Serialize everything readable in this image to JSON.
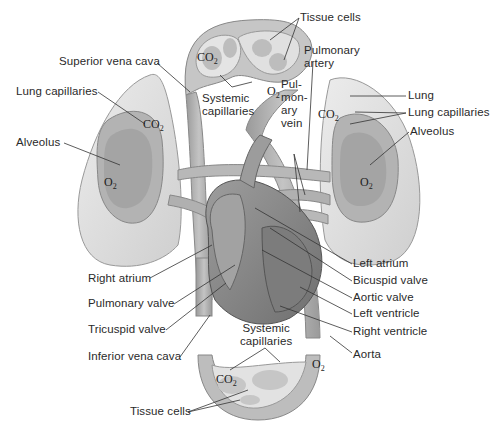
{
  "diagram": {
    "type": "circulatory-system",
    "colors": {
      "vessel": "#a9a9a9",
      "vessel_dark": "#7d7d7d",
      "lung": "#dedede",
      "lung_inner": "#b5b5b5",
      "heart": "#8f8f8f",
      "heart_dark": "#6e6e6e",
      "line": "#333333"
    },
    "labels": {
      "tissue_cells_top": "Tissue cells",
      "superior_vena_cava": "Superior vena cava",
      "systemic_capillaries_top": "Systemic\ncapillaries",
      "pulmonary_artery": "Pulmonary\nartery",
      "pulmonary_vein": "Pul-\nmon-\nary\nvein",
      "lung_capillaries_left": "Lung capillaries",
      "alveolus_left": "Alveolus",
      "lung": "Lung",
      "lung_capillaries_right": "Lung capillaries",
      "alveolus_right": "Alveolus",
      "right_atrium": "Right atrium",
      "pulmonary_valve": "Pulmonary valve",
      "tricuspid_valve": "Tricuspid valve",
      "inferior_vena_cava": "Inferior vena cava",
      "left_atrium": "Left atrium",
      "bicuspid_valve": "Bicuspid valve",
      "aortic_valve": "Aortic valve",
      "left_ventricle": "Left ventricle",
      "right_ventricle": "Right ventricle",
      "aorta": "Aorta",
      "systemic_capillaries_bottom": "Systemic\ncapillaries",
      "tissue_cells_bottom": "Tissue cells"
    },
    "gases": {
      "co2": "CO",
      "o2": "O",
      "subscript": "2"
    }
  }
}
